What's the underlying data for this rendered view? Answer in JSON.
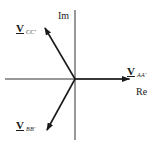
{
  "diagram": {
    "type": "phasor",
    "axes": {
      "real_label": "Re",
      "imag_label": "Im"
    },
    "vectors": [
      {
        "name": "V",
        "subscript": "AA'",
        "direction": "0°"
      },
      {
        "name": "V",
        "subscript": "BB'",
        "direction": "-120°"
      },
      {
        "name": "V",
        "subscript": "CC'",
        "direction": "120°"
      }
    ],
    "colors": {
      "line": "#1a1a1a",
      "axis": "#333333",
      "background": "#ffffff"
    }
  }
}
